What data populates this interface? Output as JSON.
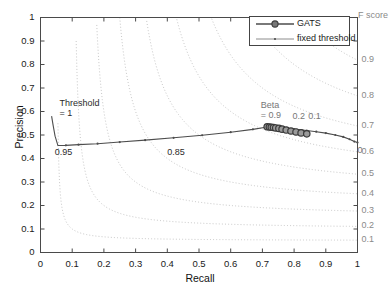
{
  "chart_data": {
    "type": "line",
    "title": "",
    "xlabel": "Recall",
    "ylabel": "Precision",
    "xlim": [
      0,
      1
    ],
    "ylim": [
      0,
      1
    ],
    "xticks": [
      "0",
      "0.1",
      "0.2",
      "0.3",
      "0.4",
      "0.5",
      "0.6",
      "0.7",
      "0.8",
      "0.9",
      "1"
    ],
    "yticks": [
      "0",
      "0.1",
      "0.2",
      "0.3",
      "0.4",
      "0.5",
      "0.6",
      "0.7",
      "0.8",
      "0.9",
      "1"
    ],
    "grid": false,
    "legend_position": "top-right",
    "right_axis_title": "F score",
    "right_axis_ticks": [
      {
        "label": "0.9",
        "value": 0.9
      },
      {
        "label": "0.8",
        "value": 0.8
      },
      {
        "label": "0.7",
        "value": 0.7
      },
      {
        "label": "0.6",
        "value": 0.6
      },
      {
        "label": "0.5",
        "value": 0.5
      },
      {
        "label": "0.4",
        "value": 0.4
      },
      {
        "label": "0.3",
        "value": 0.3
      },
      {
        "label": "0.2",
        "value": 0.2
      },
      {
        "label": "0.1",
        "value": 0.1
      }
    ],
    "iso_f_contours": [
      0.1,
      0.2,
      0.3,
      0.4,
      0.5,
      0.6,
      0.7,
      0.8,
      0.9
    ],
    "series": [
      {
        "name": "GATS",
        "marker": "circle",
        "color": "#4d4d4d",
        "points": [
          {
            "x": 0.715,
            "y": 0.535
          },
          {
            "x": 0.722,
            "y": 0.534
          },
          {
            "x": 0.728,
            "y": 0.533
          },
          {
            "x": 0.735,
            "y": 0.532
          },
          {
            "x": 0.742,
            "y": 0.53
          },
          {
            "x": 0.752,
            "y": 0.528
          },
          {
            "x": 0.762,
            "y": 0.525
          },
          {
            "x": 0.775,
            "y": 0.521
          },
          {
            "x": 0.79,
            "y": 0.517
          },
          {
            "x": 0.806,
            "y": 0.513
          },
          {
            "x": 0.822,
            "y": 0.509
          },
          {
            "x": 0.84,
            "y": 0.505
          }
        ]
      },
      {
        "name": "fixed threshold",
        "marker": "dot",
        "color": "#4d4d4d",
        "points": [
          {
            "x": 0.035,
            "y": 0.58
          },
          {
            "x": 0.04,
            "y": 0.54
          },
          {
            "x": 0.046,
            "y": 0.495
          },
          {
            "x": 0.055,
            "y": 0.455
          },
          {
            "x": 0.08,
            "y": 0.456
          },
          {
            "x": 0.12,
            "y": 0.459
          },
          {
            "x": 0.18,
            "y": 0.463
          },
          {
            "x": 0.25,
            "y": 0.47
          },
          {
            "x": 0.33,
            "y": 0.478
          },
          {
            "x": 0.42,
            "y": 0.488
          },
          {
            "x": 0.51,
            "y": 0.499
          },
          {
            "x": 0.6,
            "y": 0.512
          },
          {
            "x": 0.67,
            "y": 0.524
          },
          {
            "x": 0.715,
            "y": 0.534
          },
          {
            "x": 0.76,
            "y": 0.531
          },
          {
            "x": 0.8,
            "y": 0.525
          },
          {
            "x": 0.84,
            "y": 0.519
          },
          {
            "x": 0.87,
            "y": 0.514
          },
          {
            "x": 0.9,
            "y": 0.508
          },
          {
            "x": 0.93,
            "y": 0.5
          },
          {
            "x": 0.955,
            "y": 0.492
          },
          {
            "x": 0.975,
            "y": 0.482
          },
          {
            "x": 0.99,
            "y": 0.472
          },
          {
            "x": 1.0,
            "y": 0.468
          }
        ]
      }
    ],
    "annotations": [
      {
        "id": "threshold-1",
        "text": "Threshold",
        "text2": "= 1",
        "x": 0.06,
        "y": 0.63
      },
      {
        "id": "threshold-095",
        "text": "0.95",
        "x": 0.045,
        "y": 0.425
      },
      {
        "id": "threshold-085",
        "text": "0.85",
        "x": 0.4,
        "y": 0.425
      },
      {
        "id": "beta-09",
        "text": "Beta",
        "text2": "= 0.9",
        "x": 0.695,
        "y": 0.625
      },
      {
        "id": "beta-02",
        "text": "0.2",
        "x": 0.795,
        "y": 0.575
      },
      {
        "id": "beta-01",
        "text": "0.1",
        "x": 0.845,
        "y": 0.575
      },
      {
        "id": "beta-0",
        "text": "0",
        "x": 1.0,
        "y": 0.432
      }
    ]
  },
  "legend": {
    "items": [
      {
        "label": "GATS"
      },
      {
        "label": "fixed threshold"
      }
    ]
  },
  "colors": {
    "curve": "#4d4d4d",
    "contour": "#c8c8c8",
    "axis": "#4a4a4a",
    "fscore_text": "#8a8a8a"
  }
}
